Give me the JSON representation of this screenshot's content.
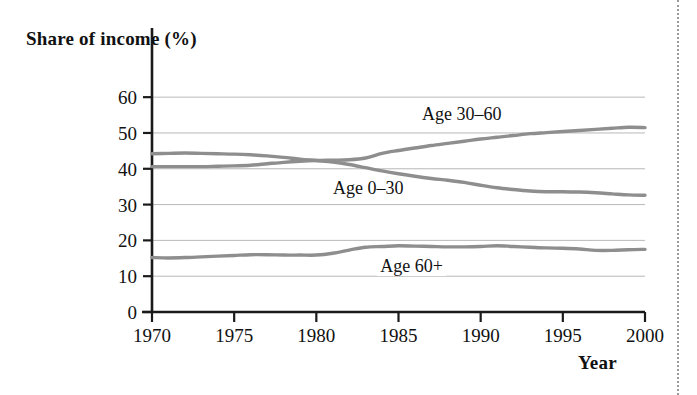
{
  "figure": {
    "background_color": "#ffffff",
    "right_rule": {
      "style": "dotted",
      "color": "#9a9a9a"
    }
  },
  "axes": {
    "y_title": "Share of income (%)",
    "x_title": "Year",
    "y_ticks": [
      "0",
      "10",
      "20",
      "30",
      "40",
      "50",
      "60"
    ],
    "x_ticks": [
      "1970",
      "1975",
      "1980",
      "1985",
      "1990",
      "1995",
      "2000"
    ]
  },
  "series_labels": {
    "age_30_60": "Age 30–60",
    "age_0_30": "Age 0–30",
    "age_60_plus": "Age 60+"
  },
  "chart_data": {
    "type": "line",
    "title": "",
    "subtitle": "",
    "xlabel": "Year",
    "ylabel": "Share of income (%)",
    "xlim": [
      1970,
      2000
    ],
    "ylim": [
      0,
      62
    ],
    "xticks": [
      1970,
      1975,
      1980,
      1985,
      1990,
      1995,
      2000
    ],
    "yticks": [
      0,
      10,
      20,
      30,
      40,
      50,
      60
    ],
    "grid": "horizontal",
    "legend": "inline-annotations",
    "line_color": "#8e8e8e",
    "x": [
      1970,
      1971,
      1972,
      1973,
      1974,
      1975,
      1976,
      1977,
      1978,
      1979,
      1980,
      1981,
      1982,
      1983,
      1984,
      1985,
      1986,
      1987,
      1988,
      1989,
      1990,
      1991,
      1992,
      1993,
      1994,
      1995,
      1996,
      1997,
      1998,
      1999,
      2000
    ],
    "series": [
      {
        "name": "Age 0–30",
        "values": [
          44.2,
          44.3,
          44.4,
          44.3,
          44.2,
          44.1,
          43.9,
          43.6,
          43.2,
          42.7,
          42.3,
          41.9,
          41.2,
          40.3,
          39.4,
          38.6,
          37.9,
          37.3,
          36.8,
          36.2,
          35.4,
          34.7,
          34.2,
          33.8,
          33.6,
          33.6,
          33.5,
          33.3,
          33.0,
          32.7,
          32.6
        ]
      },
      {
        "name": "Age 30–60",
        "values": [
          40.6,
          40.6,
          40.6,
          40.6,
          40.7,
          40.8,
          41.0,
          41.4,
          41.8,
          42.1,
          42.3,
          42.4,
          42.5,
          43.0,
          44.3,
          45.1,
          45.8,
          46.5,
          47.1,
          47.7,
          48.3,
          48.8,
          49.3,
          49.8,
          50.1,
          50.4,
          50.7,
          51.0,
          51.3,
          51.6,
          51.5
        ]
      },
      {
        "name": "Age 60+",
        "values": [
          15.2,
          15.1,
          15.2,
          15.4,
          15.6,
          15.8,
          16.0,
          16.0,
          15.9,
          15.9,
          15.9,
          16.4,
          17.3,
          18.1,
          18.3,
          18.5,
          18.4,
          18.3,
          18.2,
          18.2,
          18.3,
          18.5,
          18.3,
          18.1,
          17.9,
          17.8,
          17.6,
          17.2,
          17.2,
          17.4,
          17.5
        ]
      }
    ]
  }
}
